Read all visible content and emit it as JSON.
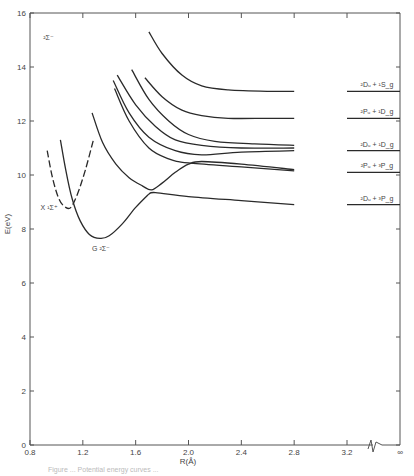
{
  "chart_data": {
    "type": "line",
    "title": "",
    "xlabel": "R(Å)",
    "ylabel": "E(eV)",
    "xlim": [
      0.8,
      3.2
    ],
    "x_break": true,
    "x_break_end_label": "∞",
    "ylim": [
      0,
      16
    ],
    "x_ticks": [
      "0.8",
      "1.2",
      "1.6",
      "2.0",
      "2.4",
      "2.8",
      "3.2"
    ],
    "y_ticks": [
      "0",
      "2",
      "4",
      "6",
      "8",
      "10",
      "12",
      "14",
      "16"
    ],
    "grid": false,
    "annotations": [
      {
        "text": "²Σ⁻",
        "x": 0.9,
        "y": 15.0
      },
      {
        "text": "X ¹Σ⁺",
        "x": 0.88,
        "y": 8.7
      },
      {
        "text": "G ²Σ⁻",
        "x": 1.27,
        "y": 7.2
      }
    ],
    "asymptotes": [
      {
        "label": "²Dᵤ + ¹S_g",
        "y": 13.1
      },
      {
        "label": "²Pᵤ + ¹D_g",
        "y": 12.1
      },
      {
        "label": "²Dᵤ + ¹D_g",
        "y": 10.9
      },
      {
        "label": "²Pᵤ + ³P_g",
        "y": 10.1
      },
      {
        "label": "²Dᵤ + ³P_g",
        "y": 8.9
      }
    ],
    "series": [
      {
        "name": "X ¹Σ⁺ (dashed)",
        "style": "dashed",
        "x": [
          0.93,
          0.97,
          1.02,
          1.07,
          1.11,
          1.16,
          1.22,
          1.28
        ],
        "y": [
          10.9,
          9.9,
          9.1,
          8.8,
          8.8,
          9.3,
          10.2,
          11.3
        ]
      },
      {
        "name": "G ²Σ⁻",
        "style": "solid",
        "x": [
          1.03,
          1.07,
          1.12,
          1.18,
          1.25,
          1.33,
          1.4,
          1.5,
          1.6,
          1.7
        ],
        "y": [
          11.3,
          10.2,
          9.1,
          8.3,
          7.8,
          7.65,
          7.75,
          8.2,
          8.8,
          9.3
        ]
      },
      {
        "name": "Lower adiabatic (→²Dᵤ+³P_g)",
        "style": "solid",
        "x": [
          1.7,
          1.75,
          2.0,
          2.4,
          2.8
        ],
        "y": [
          9.3,
          9.35,
          9.2,
          9.05,
          8.9
        ]
      },
      {
        "name": "Inner curve (→²Pᵤ+³P_g via avoided crossing)",
        "style": "solid",
        "x": [
          1.27,
          1.35,
          1.45,
          1.55,
          1.65,
          1.72,
          1.8,
          1.9,
          2.0,
          2.1,
          2.4,
          2.8
        ],
        "y": [
          12.3,
          11.2,
          10.4,
          9.9,
          9.6,
          9.45,
          9.7,
          10.1,
          10.4,
          10.5,
          10.4,
          10.2
        ]
      },
      {
        "name": "Curve (→²Pᵤ+³P_g)",
        "style": "solid",
        "x": [
          1.44,
          1.55,
          1.7,
          1.85,
          2.0,
          2.4,
          2.8
        ],
        "y": [
          13.2,
          12.0,
          11.0,
          10.6,
          10.45,
          10.3,
          10.15
        ]
      },
      {
        "name": "Curve (→²Dᵤ+¹D_g a)",
        "style": "solid",
        "x": [
          1.43,
          1.55,
          1.7,
          1.9,
          2.1,
          2.4,
          2.8
        ],
        "y": [
          13.5,
          12.3,
          11.4,
          10.9,
          10.75,
          10.85,
          10.9
        ]
      },
      {
        "name": "Curve (→²Dᵤ+¹D_g b)",
        "style": "solid",
        "x": [
          1.46,
          1.6,
          1.75,
          1.9,
          2.1,
          2.4,
          2.8
        ],
        "y": [
          13.7,
          12.6,
          11.8,
          11.3,
          11.1,
          11.0,
          11.0
        ]
      },
      {
        "name": "Curve (→²Dᵤ+¹D_g c)",
        "style": "solid",
        "x": [
          1.57,
          1.7,
          1.85,
          2.0,
          2.2,
          2.5,
          2.8
        ],
        "y": [
          13.9,
          12.8,
          12.0,
          11.5,
          11.25,
          11.15,
          11.1
        ]
      },
      {
        "name": "Curve (→²Pᵤ+¹D_g)",
        "style": "solid",
        "x": [
          1.67,
          1.8,
          1.95,
          2.1,
          2.3,
          2.6,
          2.8
        ],
        "y": [
          13.6,
          12.9,
          12.4,
          12.2,
          12.1,
          12.1,
          12.1
        ]
      },
      {
        "name": "Curve (→²Dᵤ+¹S_g)",
        "style": "solid",
        "x": [
          1.7,
          1.8,
          1.95,
          2.1,
          2.3,
          2.6,
          2.8
        ],
        "y": [
          15.3,
          14.5,
          13.7,
          13.3,
          13.15,
          13.1,
          13.1
        ]
      }
    ]
  },
  "axes": {
    "xlabel": "R(Å)",
    "ylabel": "E(eV)",
    "infinity_label": "∞"
  },
  "caption": "Figure ... Potential energy curves ..."
}
